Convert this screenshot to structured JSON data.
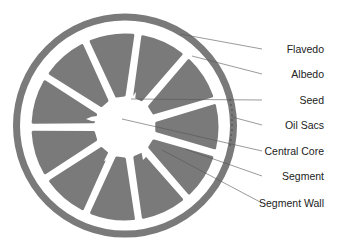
{
  "diagram": {
    "colors": {
      "peel": "#7a7a7a",
      "segment": "#7a7a7a",
      "background": "#ffffff",
      "leader_line": "#555555",
      "label_text": "#222222"
    },
    "labels": [
      {
        "id": "flavedo",
        "text": "Flavedo",
        "y": 49,
        "tx": 180,
        "ty": 34
      },
      {
        "id": "albedo",
        "text": "Albedo",
        "y": 74,
        "tx": 192,
        "ty": 56
      },
      {
        "id": "seed",
        "text": "Seed",
        "y": 100,
        "tx": 131,
        "ty": 99
      },
      {
        "id": "oil-sacs",
        "text": "Oil Sacs",
        "y": 125,
        "tx": 232,
        "ty": 117
      },
      {
        "id": "central-core",
        "text": "Central Core",
        "y": 151,
        "tx": 122,
        "ty": 119
      },
      {
        "id": "segment",
        "text": "Segment",
        "y": 176,
        "tx": 185,
        "ty": 149
      },
      {
        "id": "segment-wall",
        "text": "Segment Wall",
        "y": 203,
        "tx": 162,
        "ty": 150
      }
    ]
  }
}
